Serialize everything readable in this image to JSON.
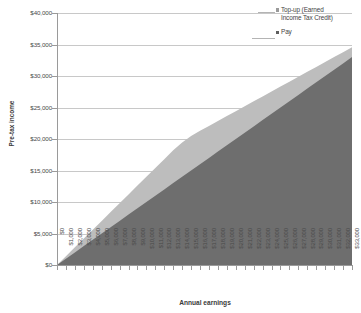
{
  "chart_data": {
    "type": "area",
    "stacked": true,
    "title": "",
    "subtitle": "",
    "xlabel": "Annual earnings",
    "ylabel": "Pre-tax income",
    "ylim": [
      0,
      40000
    ],
    "ytick_values": [
      0,
      5000,
      10000,
      15000,
      20000,
      25000,
      30000,
      35000,
      40000
    ],
    "ytick_labels": [
      "$0",
      "$5,000",
      "$10,000",
      "$15,000",
      "$20,000",
      "$25,000",
      "$30,000",
      "$35,000",
      "$40,000"
    ],
    "grid": true,
    "grid_axis": "y",
    "legend_position": "top-right",
    "categories": [
      "$0",
      "$1,000",
      "$2,000",
      "$3,000",
      "$4,000",
      "$5,000",
      "$6,000",
      "$7,000",
      "$8,000",
      "$9,000",
      "$10,000",
      "$11,000",
      "$12,000",
      "$13,000",
      "$14,000",
      "$15,000",
      "$16,000",
      "$17,000",
      "$18,000",
      "$19,000",
      "$20,000",
      "$21,000",
      "$22,000",
      "$23,000",
      "$24,000",
      "$25,000",
      "$26,000",
      "$27,000",
      "$28,000",
      "$29,000",
      "$30,000",
      "$31,000",
      "$32,000",
      "$33,000"
    ],
    "x_values": [
      0,
      1000,
      2000,
      3000,
      4000,
      5000,
      6000,
      7000,
      8000,
      9000,
      10000,
      11000,
      12000,
      13000,
      14000,
      15000,
      16000,
      17000,
      18000,
      19000,
      20000,
      21000,
      22000,
      23000,
      24000,
      25000,
      26000,
      27000,
      28000,
      29000,
      30000,
      31000,
      32000,
      33000
    ],
    "series": [
      {
        "name": "Pay",
        "color": "#6e6e6e",
        "values": [
          0,
          1000,
          2000,
          3000,
          4000,
          5000,
          6000,
          7000,
          8000,
          9000,
          10000,
          11000,
          12000,
          13000,
          14000,
          15000,
          16000,
          17000,
          18000,
          19000,
          20000,
          21000,
          22000,
          23000,
          24000,
          25000,
          26000,
          27000,
          28000,
          29000,
          30000,
          31000,
          32000,
          33000
        ]
      },
      {
        "name": "Top-up (Earned Income Tax Credit)",
        "color": "#bdbdbd",
        "values": [
          0,
          400,
          800,
          1200,
          1600,
          2000,
          2400,
          2800,
          3200,
          3600,
          4000,
          4400,
          4800,
          5200,
          5460,
          5460,
          5300,
          5080,
          4860,
          4640,
          4420,
          4200,
          3980,
          3760,
          3540,
          3320,
          3100,
          2880,
          2660,
          2440,
          2220,
          2000,
          1780,
          1560
        ]
      }
    ],
    "totals": [
      0,
      1400,
      2800,
      4200,
      5600,
      7000,
      8400,
      9800,
      11200,
      12600,
      14000,
      15400,
      16800,
      18200,
      19460,
      20460,
      21300,
      22080,
      22860,
      23640,
      24420,
      25200,
      25980,
      26760,
      27540,
      28320,
      29100,
      29880,
      30660,
      31440,
      32220,
      33000,
      33780,
      34560
    ]
  },
  "legend": {
    "entries": [
      {
        "label_line1": "Top-up (Earned",
        "label_line2": "Income Tax Credit)",
        "color": "#9a9a9a"
      },
      {
        "label_line1": "Pay",
        "label_line2": "",
        "color": "#5f5f5f"
      }
    ]
  },
  "axes": {
    "y_title": "Pre-tax income",
    "x_title": "Annual earnings"
  }
}
